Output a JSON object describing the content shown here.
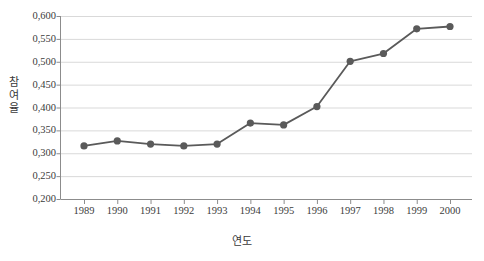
{
  "chart_data": {
    "type": "line",
    "title": "",
    "xlabel": "연도",
    "ylabel": "참여율",
    "x": [
      1989,
      1990,
      1991,
      1992,
      1993,
      1994,
      1995,
      1996,
      1997,
      1998,
      1999,
      2000
    ],
    "categories": [
      "1989",
      "1990",
      "1991",
      "1992",
      "1993",
      "1994",
      "1995",
      "1996",
      "1997",
      "1998",
      "1999",
      "2000"
    ],
    "values": [
      0.316,
      0.327,
      0.32,
      0.316,
      0.32,
      0.366,
      0.362,
      0.402,
      0.501,
      0.518,
      0.572,
      0.577
    ],
    "series": [
      {
        "name": "참여율",
        "values": [
          0.316,
          0.327,
          0.32,
          0.316,
          0.32,
          0.366,
          0.362,
          0.402,
          0.501,
          0.518,
          0.572,
          0.577
        ]
      }
    ],
    "ylim": [
      0.2,
      0.6
    ],
    "ytick_step": 0.05,
    "ytick_labels": [
      "0,600",
      "0,550",
      "0,500",
      "0,450",
      "0,400",
      "0,350",
      "0,300",
      "0,250",
      "0,200"
    ],
    "ytick_values": [
      0.6,
      0.55,
      0.5,
      0.45,
      0.4,
      0.35,
      0.3,
      0.25,
      0.2
    ],
    "grid": "horizontal",
    "legend": "none",
    "marker": "circle",
    "line_color": "#5a5a5a",
    "marker_color": "#5a5a5a",
    "grid_color": "#d9d9d9",
    "axis_color": "#8c8c8c",
    "text_color": "#3c3c3c"
  },
  "y_axis_title_chars": [
    "참",
    "여",
    "율"
  ]
}
